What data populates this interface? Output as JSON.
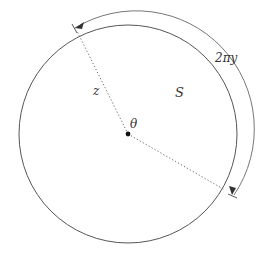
{
  "diagram": {
    "labels": {
      "radius": "z",
      "region": "S",
      "angle": "θ",
      "arc_length": "2πy"
    },
    "colors": {
      "stroke": "#555555",
      "text": "#333333",
      "background": "#ffffff"
    }
  }
}
